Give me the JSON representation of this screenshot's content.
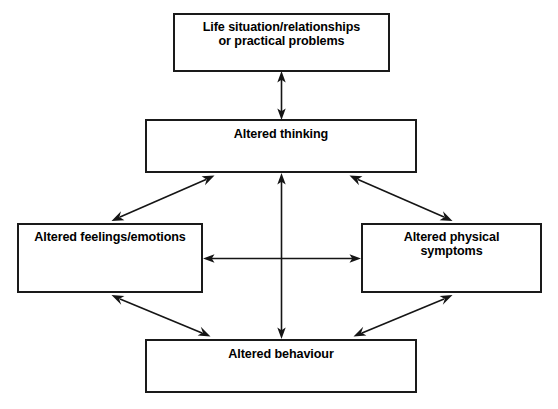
{
  "diagram": {
    "background_color": "#ffffff",
    "line_color": "#151515",
    "border_color": "#1a1a1a",
    "text_color": "#000000",
    "nodes": [
      {
        "id": "life_situation",
        "label": "Life situation/relationships\nor practical problems",
        "line1": "Life situation/relationships",
        "line2": "or practical problems"
      },
      {
        "id": "altered_thinking",
        "label": "Altered thinking",
        "line1": "Altered thinking",
        "line2": ""
      },
      {
        "id": "altered_feelings",
        "label": "Altered feelings/emotions",
        "line1": "Altered feelings/emotions",
        "line2": ""
      },
      {
        "id": "altered_physical",
        "label": "Altered physical symptoms",
        "line1": "Altered physical",
        "line2": "symptoms"
      },
      {
        "id": "altered_behaviour",
        "label": "Altered behaviour",
        "line1": "Altered behaviour",
        "line2": ""
      }
    ],
    "connections": [
      {
        "id": "life-thinking",
        "from": "life_situation",
        "to": "altered_thinking",
        "style": "double-headed-vertical"
      },
      {
        "id": "thinking-feelings",
        "from": "altered_thinking",
        "to": "altered_feelings",
        "style": "double-headed-diagonal"
      },
      {
        "id": "thinking-physical",
        "from": "altered_thinking",
        "to": "altered_physical",
        "style": "double-headed-diagonal"
      },
      {
        "id": "thinking-behaviour",
        "from": "altered_thinking",
        "to": "altered_behaviour",
        "style": "double-headed-vertical"
      },
      {
        "id": "feelings-physical",
        "from": "altered_feelings",
        "to": "altered_physical",
        "style": "double-headed-horizontal"
      },
      {
        "id": "feelings-behaviour",
        "from": "altered_feelings",
        "to": "altered_behaviour",
        "style": "double-headed-diagonal"
      },
      {
        "id": "physical-behaviour",
        "from": "altered_physical",
        "to": "altered_behaviour",
        "style": "double-headed-diagonal"
      }
    ]
  }
}
